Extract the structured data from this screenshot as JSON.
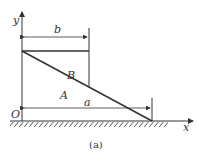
{
  "diagram": {
    "axes": {
      "x_label": "x",
      "y_label": "y",
      "origin_label": "O"
    },
    "regions": {
      "upper": "B",
      "lower": "A"
    },
    "dimensions": {
      "top_width": "b",
      "bottom_width": "a"
    },
    "caption": "(a)",
    "colors": {
      "stroke": "#333333",
      "background": "#ffffff"
    }
  }
}
